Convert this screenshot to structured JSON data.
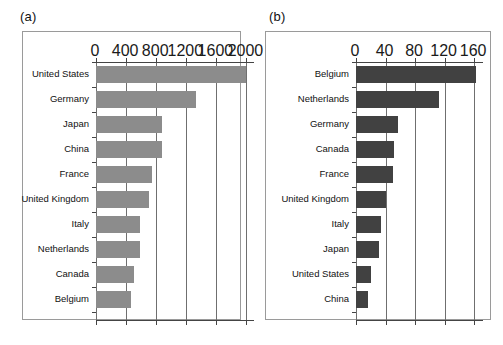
{
  "figure": {
    "background": "#ffffff",
    "panels": [
      {
        "tag": "(a)",
        "bar_color": "#8c8c8c",
        "chart": {
          "type": "bar",
          "orientation": "horizontal",
          "title": "",
          "xlabel": "",
          "ylabel": "",
          "xlim": [
            0,
            2100
          ],
          "ticks": [
            0,
            400,
            800,
            1200,
            1600,
            2000
          ],
          "tick_labels": [
            "0",
            "400",
            "800",
            "1200",
            "1600",
            "2000"
          ],
          "grid": true,
          "categories": [
            "United States",
            "Germany",
            "Japan",
            "China",
            "France",
            "United Kingdom",
            "Italy",
            "Netherlands",
            "Canada",
            "Belgium"
          ],
          "values": [
            1990,
            1330,
            880,
            880,
            740,
            700,
            590,
            580,
            500,
            470
          ]
        }
      },
      {
        "tag": "(b)",
        "bar_color": "#414141",
        "chart": {
          "type": "bar",
          "orientation": "horizontal",
          "title": "",
          "xlabel": "",
          "ylabel": "",
          "xlim": [
            0,
            172
          ],
          "ticks": [
            0,
            40,
            80,
            120,
            160
          ],
          "tick_labels": [
            "0",
            "40",
            "80",
            "120",
            "160"
          ],
          "grid": true,
          "categories": [
            "Belgium",
            "Netherlands",
            "Germany",
            "Canada",
            "France",
            "United Kingdom",
            "Italy",
            "Japan",
            "United States",
            "China"
          ],
          "values": [
            163,
            113,
            57,
            52,
            50,
            41,
            34,
            31,
            20,
            16
          ]
        }
      }
    ]
  },
  "chart_data": [
    {
      "type": "bar",
      "orientation": "horizontal",
      "panel": "(a)",
      "title": "",
      "xlabel": "",
      "ylabel": "",
      "categories": [
        "United States",
        "Germany",
        "Japan",
        "China",
        "France",
        "United Kingdom",
        "Italy",
        "Netherlands",
        "Canada",
        "Belgium"
      ],
      "values": [
        1990,
        1330,
        880,
        880,
        740,
        700,
        590,
        580,
        500,
        470
      ],
      "xlim": [
        0,
        2100
      ],
      "xticks": [
        0,
        400,
        800,
        1200,
        1600,
        2000
      ],
      "grid": true,
      "legend": null,
      "series_color": "#8c8c8c"
    },
    {
      "type": "bar",
      "orientation": "horizontal",
      "panel": "(b)",
      "title": "",
      "xlabel": "",
      "ylabel": "",
      "categories": [
        "Belgium",
        "Netherlands",
        "Germany",
        "Canada",
        "France",
        "United Kingdom",
        "Italy",
        "Japan",
        "United States",
        "China"
      ],
      "values": [
        163,
        113,
        57,
        52,
        50,
        41,
        34,
        31,
        20,
        16
      ],
      "xlim": [
        0,
        172
      ],
      "xticks": [
        0,
        40,
        80,
        120,
        160
      ],
      "grid": true,
      "legend": null,
      "series_color": "#414141"
    }
  ]
}
